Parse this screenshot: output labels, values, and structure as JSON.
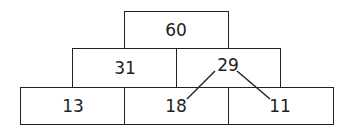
{
  "pyramid": {
    "top": {
      "value": "60"
    },
    "middle": [
      {
        "value": "31"
      },
      {
        "value": "29"
      }
    ],
    "bottom": [
      {
        "value": "13"
      },
      {
        "value": "18"
      },
      {
        "value": "11"
      }
    ]
  },
  "connectors": {
    "from": "29",
    "to": [
      "18",
      "11"
    ]
  }
}
